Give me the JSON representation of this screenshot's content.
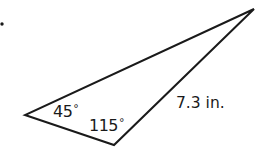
{
  "figure": {
    "type": "triangle",
    "vertices": {
      "left": [
        25,
        115
      ],
      "bottom": [
        114,
        145
      ],
      "top_right": [
        254,
        9
      ]
    },
    "stroke_color": "#1a1a1a",
    "bullet_marker": [
      2,
      24
    ]
  },
  "labels": {
    "angle_left": {
      "value": "45",
      "unit": "°"
    },
    "angle_bottom": {
      "value": "115",
      "unit": "°"
    },
    "side_right": "7.3 in."
  }
}
